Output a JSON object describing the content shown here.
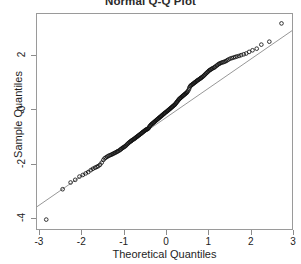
{
  "chart_data": {
    "type": "scatter",
    "title": "Normal Q-Q Plot",
    "xlabel": "Theoretical Quantiles",
    "ylabel": "Sample Quantiles",
    "xlim": [
      -3.07,
      3.0
    ],
    "ylim": [
      -4.45,
      3.55
    ],
    "xticks": [
      -3,
      -2,
      -1,
      0,
      1,
      2,
      3
    ],
    "xticklabels": [
      "-3",
      "-2",
      "-1",
      "0",
      "1",
      "2",
      "3"
    ],
    "yticks": [
      2,
      0,
      -2,
      -4
    ],
    "yticklabels": [
      "2",
      "0",
      "-2",
      "-4"
    ],
    "grid": false,
    "legend": null,
    "marker": "open-circle",
    "marker_color": "#111111",
    "refline": {
      "label": "qqline",
      "color": "#8a8a8a",
      "x": [
        -3.07,
        3.0
      ],
      "y": [
        -3.62,
        2.93
      ]
    },
    "annotations": [
      "Low outlier near (-2.85, -4.10) falls well below the reference line",
      "High outlier near (2.75, 3.20) falls above the reference line",
      "Dense overlapping band of points between -1.5 and 1.5 theoretical quantiles"
    ],
    "series": [
      {
        "name": "Sample quantiles",
        "points": [
          [
            -2.85,
            -4.1
          ],
          [
            -2.46,
            -2.97
          ],
          [
            -2.27,
            -2.72
          ],
          [
            -2.16,
            -2.62
          ],
          [
            -2.06,
            -2.5
          ],
          [
            -1.98,
            -2.44
          ],
          [
            -1.91,
            -2.38
          ],
          [
            -1.85,
            -2.33
          ],
          [
            -1.79,
            -2.26
          ],
          [
            -1.74,
            -2.21
          ],
          [
            -1.69,
            -2.17
          ],
          [
            -1.65,
            -2.14
          ],
          [
            -1.61,
            -2.11
          ],
          [
            -1.57,
            -2.06
          ],
          [
            -1.53,
            -1.98
          ],
          [
            -1.49,
            -1.88
          ],
          [
            -1.46,
            -1.82
          ],
          [
            -1.43,
            -1.79
          ],
          [
            -1.4,
            -1.76
          ],
          [
            -1.37,
            -1.73
          ],
          [
            -1.34,
            -1.71
          ],
          [
            -1.31,
            -1.69
          ],
          [
            -1.28,
            -1.67
          ],
          [
            -1.26,
            -1.65
          ],
          [
            -1.23,
            -1.63
          ],
          [
            -1.21,
            -1.61
          ],
          [
            -1.18,
            -1.59
          ],
          [
            -1.16,
            -1.57
          ],
          [
            -1.14,
            -1.55
          ],
          [
            -1.11,
            -1.53
          ],
          [
            -1.09,
            -1.5
          ],
          [
            -1.07,
            -1.48
          ],
          [
            -1.05,
            -1.45
          ],
          [
            -1.03,
            -1.43
          ],
          [
            -1.01,
            -1.41
          ],
          [
            -0.99,
            -1.39
          ],
          [
            -0.97,
            -1.37
          ],
          [
            -0.95,
            -1.34
          ],
          [
            -0.93,
            -1.31
          ],
          [
            -0.91,
            -1.28
          ],
          [
            -0.89,
            -1.25
          ],
          [
            -0.87,
            -1.22
          ],
          [
            -0.85,
            -1.2
          ],
          [
            -0.83,
            -1.18
          ],
          [
            -0.82,
            -1.16
          ],
          [
            -0.8,
            -1.14
          ],
          [
            -0.78,
            -1.12
          ],
          [
            -0.76,
            -1.1
          ],
          [
            -0.74,
            -1.08
          ],
          [
            -0.73,
            -1.06
          ],
          [
            -0.71,
            -1.04
          ],
          [
            -0.69,
            -1.02
          ],
          [
            -0.68,
            -1.0
          ],
          [
            -0.66,
            -0.98
          ],
          [
            -0.64,
            -0.96
          ],
          [
            -0.63,
            -0.94
          ],
          [
            -0.61,
            -0.92
          ],
          [
            -0.59,
            -0.9
          ],
          [
            -0.58,
            -0.88
          ],
          [
            -0.56,
            -0.86
          ],
          [
            -0.55,
            -0.84
          ],
          [
            -0.53,
            -0.82
          ],
          [
            -0.51,
            -0.8
          ],
          [
            -0.5,
            -0.78
          ],
          [
            -0.48,
            -0.76
          ],
          [
            -0.47,
            -0.75
          ],
          [
            -0.45,
            -0.74
          ],
          [
            -0.44,
            -0.73
          ],
          [
            -0.42,
            -0.71
          ],
          [
            -0.41,
            -0.68
          ],
          [
            -0.39,
            -0.64
          ],
          [
            -0.38,
            -0.61
          ],
          [
            -0.36,
            -0.58
          ],
          [
            -0.35,
            -0.56
          ],
          [
            -0.33,
            -0.54
          ],
          [
            -0.32,
            -0.52
          ],
          [
            -0.3,
            -0.5
          ],
          [
            -0.29,
            -0.48
          ],
          [
            -0.27,
            -0.46
          ],
          [
            -0.26,
            -0.44
          ],
          [
            -0.24,
            -0.42
          ],
          [
            -0.23,
            -0.4
          ],
          [
            -0.21,
            -0.38
          ],
          [
            -0.2,
            -0.36
          ],
          [
            -0.18,
            -0.34
          ],
          [
            -0.17,
            -0.32
          ],
          [
            -0.15,
            -0.3
          ],
          [
            -0.14,
            -0.28
          ],
          [
            -0.12,
            -0.26
          ],
          [
            -0.11,
            -0.24
          ],
          [
            -0.09,
            -0.22
          ],
          [
            -0.08,
            -0.2
          ],
          [
            -0.06,
            -0.18
          ],
          [
            -0.05,
            -0.16
          ],
          [
            -0.03,
            -0.14
          ],
          [
            -0.02,
            -0.12
          ],
          [
            0.0,
            -0.1
          ],
          [
            0.02,
            -0.08
          ],
          [
            0.03,
            -0.06
          ],
          [
            0.05,
            -0.04
          ],
          [
            0.06,
            -0.02
          ],
          [
            0.08,
            0.0
          ],
          [
            0.09,
            0.02
          ],
          [
            0.11,
            0.04
          ],
          [
            0.12,
            0.06
          ],
          [
            0.14,
            0.08
          ],
          [
            0.15,
            0.1
          ],
          [
            0.17,
            0.12
          ],
          [
            0.18,
            0.14
          ],
          [
            0.2,
            0.16
          ],
          [
            0.21,
            0.18
          ],
          [
            0.23,
            0.21
          ],
          [
            0.24,
            0.24
          ],
          [
            0.26,
            0.27
          ],
          [
            0.27,
            0.3
          ],
          [
            0.29,
            0.33
          ],
          [
            0.3,
            0.36
          ],
          [
            0.32,
            0.39
          ],
          [
            0.33,
            0.41
          ],
          [
            0.35,
            0.43
          ],
          [
            0.36,
            0.45
          ],
          [
            0.38,
            0.47
          ],
          [
            0.39,
            0.49
          ],
          [
            0.41,
            0.51
          ],
          [
            0.42,
            0.53
          ],
          [
            0.44,
            0.55
          ],
          [
            0.45,
            0.57
          ],
          [
            0.47,
            0.59
          ],
          [
            0.48,
            0.61
          ],
          [
            0.5,
            0.63
          ],
          [
            0.51,
            0.66
          ],
          [
            0.53,
            0.7
          ],
          [
            0.55,
            0.76
          ],
          [
            0.56,
            0.82
          ],
          [
            0.58,
            0.86
          ],
          [
            0.59,
            0.89
          ],
          [
            0.61,
            0.91
          ],
          [
            0.63,
            0.93
          ],
          [
            0.64,
            0.95
          ],
          [
            0.66,
            0.97
          ],
          [
            0.68,
            0.99
          ],
          [
            0.69,
            1.01
          ],
          [
            0.71,
            1.03
          ],
          [
            0.73,
            1.05
          ],
          [
            0.74,
            1.07
          ],
          [
            0.76,
            1.09
          ],
          [
            0.78,
            1.11
          ],
          [
            0.8,
            1.13
          ],
          [
            0.82,
            1.15
          ],
          [
            0.83,
            1.17
          ],
          [
            0.85,
            1.19
          ],
          [
            0.87,
            1.21
          ],
          [
            0.89,
            1.24
          ],
          [
            0.91,
            1.27
          ],
          [
            0.93,
            1.3
          ],
          [
            0.95,
            1.33
          ],
          [
            0.97,
            1.36
          ],
          [
            0.99,
            1.39
          ],
          [
            1.01,
            1.42
          ],
          [
            1.03,
            1.45
          ],
          [
            1.05,
            1.47
          ],
          [
            1.07,
            1.49
          ],
          [
            1.09,
            1.51
          ],
          [
            1.11,
            1.53
          ],
          [
            1.14,
            1.55
          ],
          [
            1.16,
            1.57
          ],
          [
            1.18,
            1.6
          ],
          [
            1.21,
            1.63
          ],
          [
            1.23,
            1.66
          ],
          [
            1.26,
            1.69
          ],
          [
            1.28,
            1.71
          ],
          [
            1.31,
            1.73
          ],
          [
            1.34,
            1.75
          ],
          [
            1.37,
            1.76
          ],
          [
            1.4,
            1.78
          ],
          [
            1.43,
            1.8
          ],
          [
            1.46,
            1.83
          ],
          [
            1.49,
            1.86
          ],
          [
            1.53,
            1.89
          ],
          [
            1.57,
            1.91
          ],
          [
            1.61,
            1.93
          ],
          [
            1.65,
            1.95
          ],
          [
            1.69,
            1.97
          ],
          [
            1.74,
            1.99
          ],
          [
            1.79,
            2.02
          ],
          [
            1.85,
            2.05
          ],
          [
            1.91,
            2.08
          ],
          [
            1.98,
            2.14
          ],
          [
            2.06,
            2.2
          ],
          [
            2.16,
            2.26
          ],
          [
            2.27,
            2.41
          ],
          [
            2.46,
            2.52
          ],
          [
            2.75,
            3.2
          ]
        ]
      }
    ]
  }
}
